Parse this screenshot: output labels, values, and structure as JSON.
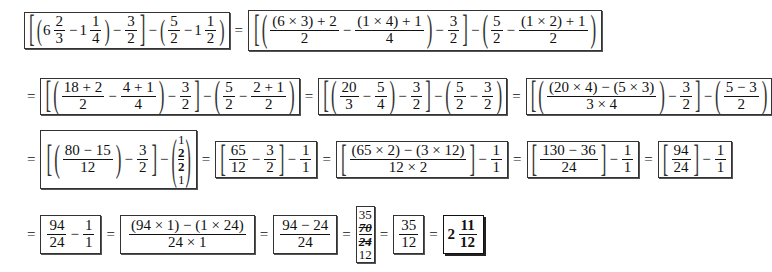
{
  "document": {
    "title": "Fraction simplification steps",
    "rows": [
      {
        "steps": [
          {
            "label": "[ (6 2/3 - 1 1/4) - 3/2 ] - (5/2 - 1 1/2)"
          },
          {
            "label": "[ ( ((6×3)+2)/2 - ((1×4)+1)/4 ) - 3/2 ] - ( 5/2 - ((1×2)+1)/2 )"
          }
        ]
      },
      {
        "steps": [
          {
            "label": "[ ( (18+2)/2 - (4+1)/4 ) - 3/2 ] - ( 5/2 - (2+1)/2 )"
          },
          {
            "label": "[ ( 20/3 - 5/4 ) - 3/2 ] - ( 5/2 - 3/2 )"
          },
          {
            "label": "[ ( ((20×4)-(5×3))/(3×4) ) - 3/2 ] - ( (5-3)/2 )"
          }
        ]
      },
      {
        "steps": [
          {
            "label": "[ ( (80-15)/12 ) - 3/2 ] - ( 1 2 / 2 1 )"
          },
          {
            "label": "[ 65/12 - 3/2 ] - 1/1"
          },
          {
            "label": "[ ((65×2)-(3×12))/(12×2) ] - 1/1"
          },
          {
            "label": "[ (130-36)/24 ] - 1/1"
          },
          {
            "label": "[ 94/24 ] - 1/1"
          }
        ]
      },
      {
        "steps": [
          {
            "label": "94/24 - 1/1"
          },
          {
            "label": "((94×1)-(1×24))/(24×1)"
          },
          {
            "label": "(94-24)/24"
          },
          {
            "label": "35 70(struck) / 24(struck) 12"
          },
          {
            "label": "35/12"
          },
          {
            "label": "2 11/12"
          }
        ]
      }
    ],
    "t": {
      "eq": "=",
      "minus": "−",
      "lb": "[",
      "rb": "]",
      "lp": "(",
      "rp": ")",
      "six": "6",
      "one": "1",
      "two": "2",
      "three": "3",
      "four": "4",
      "five": "5",
      "n6x3p2": "(6 × 3) + 2",
      "n1x4p1": "(1 × 4) + 1",
      "n1x2p1": "(1 × 2) + 1",
      "n18p2": "18 + 2",
      "n4p1": "4 + 1",
      "n2p1": "2 + 1",
      "n20": "20",
      "n20x4m5x3": "(20 × 4) − (5 × 3)",
      "d3x4": "3 × 4",
      "n5m3": "5 − 3",
      "n80m15": "80 − 15",
      "n12": "12",
      "n65": "65",
      "n65x2m3x12": "(65 × 2) − (3 × 12)",
      "d12x2": "12 × 2",
      "n130m36": "130 − 36",
      "n24": "24",
      "n94": "94",
      "n94x1m1x24": "(94 × 1) − (1 × 24)",
      "d24x1": "24 × 1",
      "n94m24": "94 − 24",
      "n35": "35",
      "n70": "70",
      "n11": "11"
    }
  }
}
